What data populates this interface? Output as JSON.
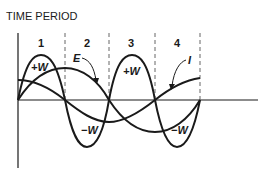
{
  "diagram": {
    "title": "TIME PERIOD",
    "periods": [
      "1",
      "2",
      "3",
      "4"
    ],
    "curve_labels": {
      "power_positive_1": "+W",
      "power_positive_2": "+W",
      "power_negative_1": "−W",
      "power_negative_2": "−W",
      "voltage": "E",
      "current": "I"
    },
    "colors": {
      "ink": "#1a1a1a",
      "dash": "#666666",
      "background": "#ffffff"
    }
  }
}
